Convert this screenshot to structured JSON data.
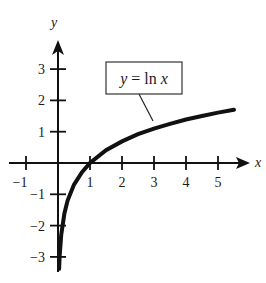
{
  "chart_data": {
    "type": "line",
    "title": "",
    "xlabel": "x",
    "ylabel": "y",
    "xlim": [
      -1.3,
      5.8
    ],
    "ylim": [
      -3.4,
      3.8
    ],
    "grid": false,
    "x_ticks": [
      -1,
      1,
      2,
      3,
      4,
      5
    ],
    "y_ticks": [
      3,
      2,
      1,
      -1,
      -2,
      -3
    ],
    "x_tick_labels": [
      "−1",
      "1",
      "2",
      "3",
      "4",
      "5"
    ],
    "y_tick_labels": [
      "3",
      "2",
      "1",
      "−1",
      "−2",
      "−3"
    ],
    "series": [
      {
        "name": "y = ln x",
        "function": "ln(x)",
        "x": [
          0.034,
          0.05,
          0.1,
          0.2,
          0.3,
          0.5,
          0.75,
          1,
          1.5,
          2,
          2.5,
          3,
          3.5,
          4,
          4.5,
          5,
          5.5
        ],
        "values": [
          -3.38,
          -3.0,
          -2.3,
          -1.61,
          -1.2,
          -0.69,
          -0.29,
          0,
          0.41,
          0.69,
          0.92,
          1.1,
          1.25,
          1.39,
          1.5,
          1.61,
          1.7
        ]
      }
    ],
    "annotations": [
      {
        "text": "y = ln x",
        "boxed": true,
        "points_to_x": 3.0
      }
    ]
  },
  "axes": {
    "x_label": "x",
    "y_label": "y"
  },
  "annotation": {
    "lhs": "y",
    "eq": " = ",
    "fn": "ln",
    "var": "x"
  },
  "colors": {
    "ink": "#111111",
    "background": "#ffffff"
  }
}
